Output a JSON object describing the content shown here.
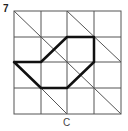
{
  "figure": {
    "number": "7",
    "caption": "C",
    "grid": {
      "cols": 4,
      "rows": 4
    },
    "thin_diagonals": [
      [
        [
          0,
          0
        ],
        [
          4,
          4
        ]
      ],
      [
        [
          2,
          0
        ],
        [
          4,
          2
        ]
      ],
      [
        [
          1,
          3
        ],
        [
          2,
          4
        ]
      ]
    ],
    "shape_vertices": [
      [
        0,
        2
      ],
      [
        1,
        2
      ],
      [
        2,
        1
      ],
      [
        3,
        1
      ],
      [
        3,
        2
      ],
      [
        2,
        3
      ],
      [
        1,
        3
      ]
    ],
    "colors": {
      "grid": "#555555",
      "shape": "#111111"
    }
  }
}
